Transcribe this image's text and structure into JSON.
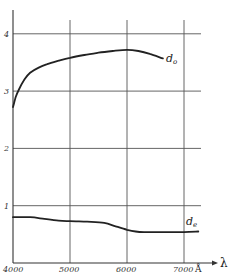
{
  "chart_data": {
    "type": "line",
    "title": "",
    "xlabel": "λ",
    "x_unit": "Å",
    "ylabel": "",
    "xlim": [
      4000,
      7250
    ],
    "ylim": [
      0,
      4.2
    ],
    "grid": true,
    "x_ticks": [
      4000,
      5000,
      6000,
      7000
    ],
    "x_tick_labels": [
      "4000",
      "5000",
      "6000",
      "7000"
    ],
    "y_ticks": [
      1,
      2,
      3,
      4
    ],
    "y_tick_labels": [
      "1",
      "2",
      "3",
      "4"
    ],
    "legend": "inline labels at curve ends",
    "series": [
      {
        "name": "d₀",
        "label_main": "d",
        "label_sub": "o",
        "x": [
          4000,
          4050,
          4100,
          4200,
          4300,
          4450,
          4600,
          4800,
          5000,
          5250,
          5500,
          5750,
          6000,
          6200,
          6400,
          6630
        ],
        "values": [
          2.72,
          2.9,
          3.02,
          3.2,
          3.32,
          3.41,
          3.47,
          3.53,
          3.58,
          3.63,
          3.67,
          3.7,
          3.72,
          3.7,
          3.65,
          3.57
        ]
      },
      {
        "name": "dₑ",
        "label_main": "d",
        "label_sub": "e",
        "x": [
          4000,
          4300,
          4550,
          4800,
          5000,
          5300,
          5600,
          5800,
          6000,
          6150,
          6300,
          6600,
          7000,
          7250
        ],
        "values": [
          0.8,
          0.8,
          0.77,
          0.74,
          0.73,
          0.72,
          0.7,
          0.64,
          0.58,
          0.55,
          0.54,
          0.54,
          0.54,
          0.55
        ]
      }
    ]
  }
}
